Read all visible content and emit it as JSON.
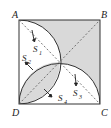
{
  "diagram": {
    "type": "geometry",
    "vertices": {
      "A": "A",
      "B": "B",
      "C": "C",
      "D": "D"
    },
    "regions": {
      "S1": "S",
      "S2": "S",
      "S3": "S",
      "S4": "S"
    },
    "subscripts": {
      "S1": "1",
      "S2": "2",
      "S3": "3",
      "S4": "4"
    },
    "colors": {
      "shade": "#d9d9d9",
      "stroke": "#333333",
      "background": "#ffffff"
    }
  }
}
